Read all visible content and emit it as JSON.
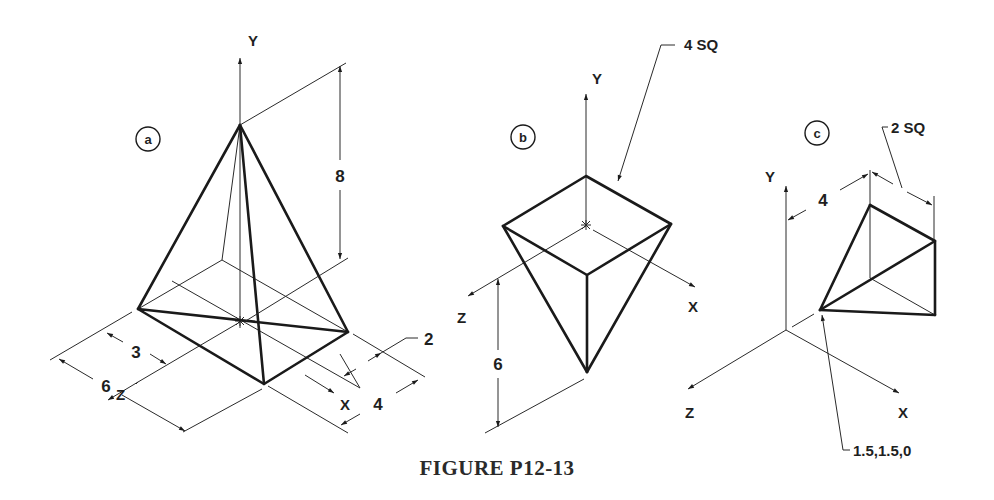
{
  "figure": {
    "caption": "FIGURE P12-13",
    "colors": {
      "ink": "#1a1a1a",
      "background": "#ffffff"
    }
  },
  "views": [
    {
      "id": "a",
      "label": "a",
      "description": "Square pyramid, apex up",
      "axes": {
        "y": "Y",
        "z": "Z",
        "x": "X"
      },
      "dimensions": {
        "height": "8",
        "z_offset": "3",
        "z_width": "6",
        "x_offset": "2",
        "x_width": "4"
      }
    },
    {
      "id": "b",
      "label": "b",
      "description": "Inverted square pyramid, apex down",
      "axes": {
        "y": "Y",
        "z": "Z",
        "x": "X"
      },
      "dimensions": {
        "base_note": "4 SQ",
        "depth": "6"
      }
    },
    {
      "id": "c",
      "label": "c",
      "description": "Pyramid with apex at given point",
      "axes": {
        "y": "Y",
        "z": "Z",
        "x": "X"
      },
      "dimensions": {
        "base_note": "2 SQ",
        "offset": "4",
        "apex_point": "1.5,1.5,0"
      }
    }
  ]
}
